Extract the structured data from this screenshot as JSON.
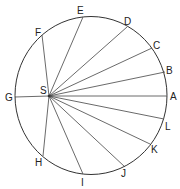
{
  "diagram": {
    "type": "circle-with-radiating-chords",
    "circle": {
      "cx": 91,
      "cy": 95.5,
      "rx": 76,
      "ry": 79,
      "stroke": "#333333"
    },
    "focus": {
      "label": "S",
      "x": 49,
      "y": 96,
      "label_x": 40,
      "label_y": 94
    },
    "points": [
      {
        "label": "A",
        "x": 167,
        "y": 96,
        "label_x": 170,
        "label_y": 100
      },
      {
        "label": "B",
        "x": 165,
        "y": 72,
        "label_x": 166,
        "label_y": 74
      },
      {
        "label": "C",
        "x": 152,
        "y": 48,
        "label_x": 153,
        "label_y": 49
      },
      {
        "label": "D",
        "x": 127,
        "y": 27,
        "label_x": 124,
        "label_y": 25
      },
      {
        "label": "E",
        "x": 83,
        "y": 17,
        "label_x": 77,
        "label_y": 14
      },
      {
        "label": "F",
        "x": 42,
        "y": 35,
        "label_x": 35,
        "label_y": 36
      },
      {
        "label": "G",
        "x": 15,
        "y": 97,
        "label_x": 5,
        "label_y": 101
      },
      {
        "label": "H",
        "x": 43,
        "y": 156,
        "label_x": 35,
        "label_y": 166
      },
      {
        "label": "I",
        "x": 83,
        "y": 174,
        "label_x": 81,
        "label_y": 186
      },
      {
        "label": "J",
        "x": 125,
        "y": 167,
        "label_x": 121,
        "label_y": 177
      },
      {
        "label": "K",
        "x": 150,
        "y": 144,
        "label_x": 151,
        "label_y": 153
      },
      {
        "label": "L",
        "x": 164,
        "y": 119,
        "label_x": 165,
        "label_y": 130
      }
    ]
  }
}
